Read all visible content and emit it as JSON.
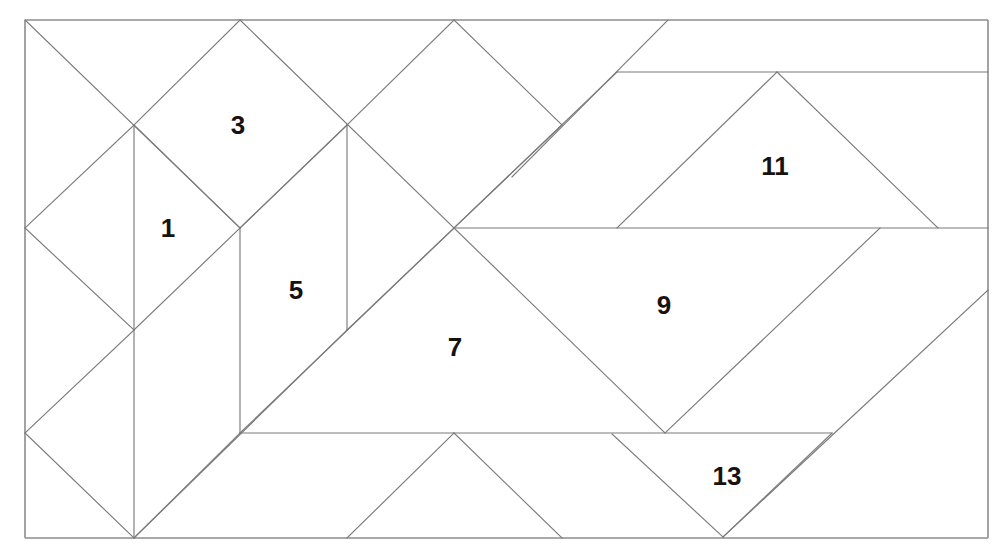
{
  "figure": {
    "type": "line-diagram",
    "canvas": {
      "width": 1008,
      "height": 558
    },
    "background_color": "#ffffff",
    "line_color": "#7a7a7a",
    "frame_color": "#8d8d8d",
    "label_color": "#18120f",
    "border": {
      "x": 25,
      "y": 20,
      "width": 963,
      "height": 518
    },
    "labels": [
      {
        "text": "1",
        "x": 168,
        "y": 230
      },
      {
        "text": "3",
        "x": 238,
        "y": 127
      },
      {
        "text": "5",
        "x": 296,
        "y": 292
      },
      {
        "text": "7",
        "x": 455,
        "y": 349
      },
      {
        "text": "9",
        "x": 664,
        "y": 307
      },
      {
        "text": "11",
        "x": 775,
        "y": 168
      },
      {
        "text": "13",
        "x": 727,
        "y": 478
      }
    ],
    "segments": [
      {
        "name": "frame-top",
        "x1": 25,
        "y1": 20,
        "x2": 988,
        "y2": 20
      },
      {
        "name": "frame-right",
        "x1": 988,
        "y1": 20,
        "x2": 988,
        "y2": 538
      },
      {
        "name": "frame-bottom",
        "x1": 988,
        "y1": 538,
        "x2": 25,
        "y2": 538
      },
      {
        "name": "frame-left",
        "x1": 25,
        "y1": 538,
        "x2": 25,
        "y2": 20
      },
      {
        "name": "diag-a1",
        "x1": 25,
        "y1": 20,
        "x2": 240,
        "y2": 228
      },
      {
        "name": "diag-a2",
        "x1": 240,
        "y1": 20,
        "x2": 134,
        "y2": 125
      },
      {
        "name": "diag-a3",
        "x1": 134,
        "y1": 125,
        "x2": 25,
        "y2": 228
      },
      {
        "name": "diag-a4",
        "x1": 134,
        "y1": 125,
        "x2": 240,
        "y2": 228
      },
      {
        "name": "diag-a5",
        "x1": 25,
        "y1": 228,
        "x2": 134,
        "y2": 330
      },
      {
        "name": "diag-a6",
        "x1": 134,
        "y1": 330,
        "x2": 240,
        "y2": 228
      },
      {
        "name": "diag-a7",
        "x1": 134,
        "y1": 330,
        "x2": 25,
        "y2": 433
      },
      {
        "name": "diag-a8",
        "x1": 25,
        "y1": 433,
        "x2": 134,
        "y2": 538
      },
      {
        "name": "diag-a9",
        "x1": 134,
        "y1": 538,
        "x2": 240,
        "y2": 433
      },
      {
        "name": "vert-b1",
        "x1": 134,
        "y1": 125,
        "x2": 134,
        "y2": 538
      },
      {
        "name": "vert-b2",
        "x1": 240,
        "y1": 228,
        "x2": 240,
        "y2": 433
      },
      {
        "name": "vert-b3",
        "x1": 347,
        "y1": 125,
        "x2": 347,
        "y2": 330
      },
      {
        "name": "diag-c1",
        "x1": 240,
        "y1": 20,
        "x2": 454,
        "y2": 228
      },
      {
        "name": "diag-c2",
        "x1": 454,
        "y1": 20,
        "x2": 347,
        "y2": 125
      },
      {
        "name": "diag-c3",
        "x1": 347,
        "y1": 125,
        "x2": 240,
        "y2": 228
      },
      {
        "name": "diag-c4",
        "x1": 454,
        "y1": 20,
        "x2": 562,
        "y2": 125
      },
      {
        "name": "diag-c5",
        "x1": 562,
        "y1": 125,
        "x2": 454,
        "y2": 228
      },
      {
        "name": "diag-c6",
        "x1": 347,
        "y1": 125,
        "x2": 240,
        "y2": 228
      },
      {
        "name": "diag-d1",
        "x1": 240,
        "y1": 433,
        "x2": 454,
        "y2": 228
      },
      {
        "name": "diag-d2",
        "x1": 454,
        "y1": 228,
        "x2": 665,
        "y2": 433
      },
      {
        "name": "diag-d3",
        "x1": 454,
        "y1": 228,
        "x2": 347,
        "y2": 330
      },
      {
        "name": "diag-d4",
        "x1": 134,
        "y1": 538,
        "x2": 347,
        "y2": 330
      },
      {
        "name": "horiz-e1",
        "x1": 454,
        "y1": 228,
        "x2": 988,
        "y2": 228
      },
      {
        "name": "horiz-e2",
        "x1": 240,
        "y1": 433,
        "x2": 832,
        "y2": 433
      },
      {
        "name": "horiz-e3",
        "x1": 617,
        "y1": 72,
        "x2": 988,
        "y2": 72
      },
      {
        "name": "diag-f1",
        "x1": 512,
        "y1": 177,
        "x2": 668,
        "y2": 20
      },
      {
        "name": "diag-f2",
        "x1": 617,
        "y1": 72,
        "x2": 454,
        "y2": 228
      },
      {
        "name": "diag-g1",
        "x1": 617,
        "y1": 228,
        "x2": 777,
        "y2": 72
      },
      {
        "name": "diag-g2",
        "x1": 777,
        "y1": 72,
        "x2": 938,
        "y2": 228
      },
      {
        "name": "diag-h1",
        "x1": 880,
        "y1": 228,
        "x2": 665,
        "y2": 433
      },
      {
        "name": "diag-h2",
        "x1": 988,
        "y1": 290,
        "x2": 723,
        "y2": 537
      },
      {
        "name": "diag-i1",
        "x1": 612,
        "y1": 434,
        "x2": 723,
        "y2": 537
      },
      {
        "name": "diag-i2",
        "x1": 832,
        "y1": 433,
        "x2": 723,
        "y2": 537
      },
      {
        "name": "diag-j1",
        "x1": 454,
        "y1": 433,
        "x2": 562,
        "y2": 538
      },
      {
        "name": "diag-j2",
        "x1": 347,
        "y1": 538,
        "x2": 454,
        "y2": 433
      }
    ]
  }
}
